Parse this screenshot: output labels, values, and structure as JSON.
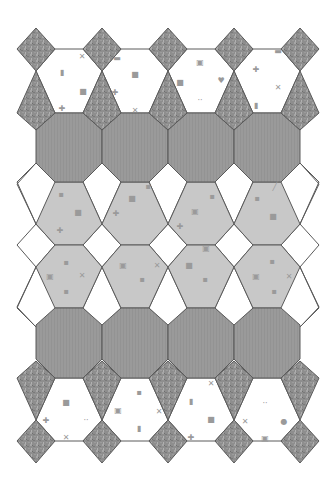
{
  "tiling": {
    "title": "",
    "column_spacing": 66,
    "columns_x": [
      36,
      102,
      168,
      234,
      300
    ],
    "colors": {
      "background": "#ffffff",
      "stroke": "#5a5a5a",
      "textured_stone": "#8e8e8e",
      "octagon_dark": "#9a9a9a",
      "hexagon_light": "#c8c8c8",
      "white_tile": "#ffffff",
      "glyph": "#9a9a9a"
    },
    "rows": {
      "top_diamond": {
        "top": 28,
        "mid": 49,
        "bottom": 71,
        "half_width": 19
      },
      "top_kite": {
        "top": 71,
        "mid": 113,
        "bottom": 130
      },
      "octagon_row_1": {
        "top": 113,
        "bottom": 182
      },
      "hex_row_1": {
        "top": 182,
        "mid": 224,
        "bottom": 245
      },
      "hex_row_2": {
        "top": 245,
        "mid": 267,
        "bottom": 308
      },
      "octagon_row_2": {
        "top": 308,
        "bottom": 378
      },
      "bottom_kite": {
        "top": 361,
        "mid": 378,
        "bottom": 420
      },
      "bottom_diamond": {
        "top": 420,
        "mid": 441,
        "bottom": 463,
        "half_width": 19
      }
    },
    "tile_counts": {
      "top_diamonds": 5,
      "top_kites": 5,
      "top_white_hexagons": 4,
      "octagons_row_1": 4,
      "light_hexagons_row_1": 4,
      "light_hexagons_row_2": 4,
      "octagons_row_2": 4,
      "bottom_kites": 5,
      "bottom_white_hexagons": 4,
      "bottom_diamonds": 5,
      "side_white_tiles_left": 3,
      "side_white_tiles_right": 3
    },
    "icons": {
      "top_white_hexagons": [
        [
          {
            "glyph": "▮",
            "x": 62,
            "y": 72
          },
          {
            "glyph": "■",
            "x": 83,
            "y": 91
          },
          {
            "glyph": "✚",
            "x": 62,
            "y": 108
          },
          {
            "glyph": "✕",
            "x": 82,
            "y": 56
          }
        ],
        [
          {
            "glyph": "■",
            "x": 135,
            "y": 74
          },
          {
            "glyph": "✚",
            "x": 115,
            "y": 92
          },
          {
            "glyph": "✕",
            "x": 135,
            "y": 110
          },
          {
            "glyph": "▬",
            "x": 117,
            "y": 58
          }
        ],
        [
          {
            "glyph": "▣",
            "x": 200,
            "y": 62
          },
          {
            "glyph": "■",
            "x": 180,
            "y": 82
          },
          {
            "glyph": "♥",
            "x": 221,
            "y": 80
          },
          {
            "glyph": "··",
            "x": 200,
            "y": 100
          }
        ],
        [
          {
            "glyph": "✚",
            "x": 256,
            "y": 69
          },
          {
            "glyph": "✕",
            "x": 278,
            "y": 87
          },
          {
            "glyph": "▮",
            "x": 256,
            "y": 105
          },
          {
            "glyph": "▬",
            "x": 278,
            "y": 51
          }
        ]
      ],
      "hex_row_1": [
        [
          {
            "glyph": "▪",
            "x": 61,
            "y": 194
          },
          {
            "glyph": "■",
            "x": 78,
            "y": 212
          },
          {
            "glyph": "✚",
            "x": 60,
            "y": 230
          }
        ],
        [
          {
            "glyph": "▪",
            "x": 148,
            "y": 186
          },
          {
            "glyph": "■",
            "x": 132,
            "y": 198
          },
          {
            "glyph": "✚",
            "x": 116,
            "y": 213
          }
        ],
        [
          {
            "glyph": "▪",
            "x": 212,
            "y": 196
          },
          {
            "glyph": "▣",
            "x": 195,
            "y": 211
          },
          {
            "glyph": "✚",
            "x": 180,
            "y": 226
          }
        ],
        [
          {
            "glyph": "╱",
            "x": 275,
            "y": 186
          },
          {
            "glyph": "▪",
            "x": 257,
            "y": 198
          },
          {
            "glyph": "■",
            "x": 273,
            "y": 216
          }
        ]
      ],
      "hex_row_2": [
        [
          {
            "glyph": "▪",
            "x": 66,
            "y": 262
          },
          {
            "glyph": "▣",
            "x": 50,
            "y": 276
          },
          {
            "glyph": "✕",
            "x": 82,
            "y": 275
          },
          {
            "glyph": "▪",
            "x": 66,
            "y": 291
          }
        ],
        [
          {
            "glyph": "▣",
            "x": 123,
            "y": 265
          },
          {
            "glyph": "▪",
            "x": 142,
            "y": 279
          },
          {
            "glyph": "✕",
            "x": 157,
            "y": 265
          }
        ],
        [
          {
            "glyph": "▣",
            "x": 206,
            "y": 248
          },
          {
            "glyph": "■",
            "x": 189,
            "y": 265
          },
          {
            "glyph": "▪",
            "x": 205,
            "y": 279
          }
        ],
        [
          {
            "glyph": "▪",
            "x": 272,
            "y": 261
          },
          {
            "glyph": "▣",
            "x": 256,
            "y": 276
          },
          {
            "glyph": "✕",
            "x": 289,
            "y": 276
          },
          {
            "glyph": "▪",
            "x": 274,
            "y": 291
          }
        ]
      ],
      "bottom_white_hexagons": [
        [
          {
            "glyph": "■",
            "x": 66,
            "y": 402
          },
          {
            "glyph": "✚",
            "x": 46,
            "y": 420
          },
          {
            "glyph": "··",
            "x": 86,
            "y": 420
          },
          {
            "glyph": "✕",
            "x": 66,
            "y": 437
          }
        ],
        [
          {
            "glyph": "▪",
            "x": 139,
            "y": 392
          },
          {
            "glyph": "▣",
            "x": 118,
            "y": 410
          },
          {
            "glyph": "✕",
            "x": 159,
            "y": 411
          },
          {
            "glyph": "▮",
            "x": 139,
            "y": 428
          }
        ],
        [
          {
            "glyph": "▮",
            "x": 191,
            "y": 401
          },
          {
            "glyph": "■",
            "x": 211,
            "y": 419
          },
          {
            "glyph": "✚",
            "x": 191,
            "y": 437
          },
          {
            "glyph": "✕",
            "x": 211,
            "y": 383
          }
        ],
        [
          {
            "glyph": "··",
            "x": 265,
            "y": 403
          },
          {
            "glyph": "✕",
            "x": 245,
            "y": 421
          },
          {
            "glyph": "●",
            "x": 284,
            "y": 421
          },
          {
            "glyph": "▣",
            "x": 265,
            "y": 438
          }
        ]
      ]
    }
  }
}
